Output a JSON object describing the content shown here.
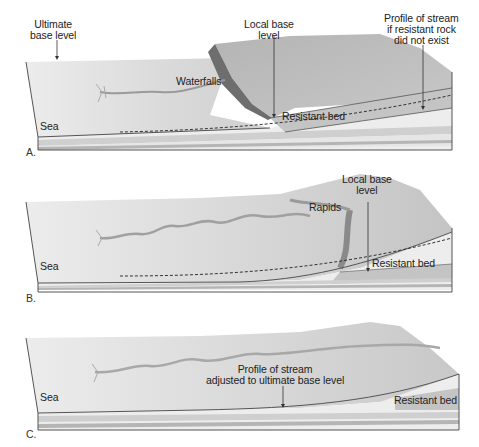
{
  "figure": {
    "colors": {
      "surface_light": "#e8e8e8",
      "surface_mid": "#d2d2d2",
      "upland_dark": "#a8a8a8",
      "cliff": "#6e6e6e",
      "layer_light": "#ededed",
      "layer_mid": "#cfcfcf",
      "layer_dark": "#b5b5b5",
      "resistant_bed": "#c4c4c4",
      "outline": "#555555",
      "text": "#222222"
    },
    "panels": [
      {
        "letter": "A.",
        "labels": {
          "ultimate_base_level_line1": "Ultimate",
          "ultimate_base_level_line2": "base level",
          "local_base_level_line1": "Local base",
          "local_base_level_line2": "level",
          "profile_line1": "Profile of stream",
          "profile_line2": "if resistant rock",
          "profile_line3": "did not exist",
          "waterfalls": "Waterfalls",
          "resistant_bed": "Resistant bed",
          "sea": "Sea"
        }
      },
      {
        "letter": "B.",
        "labels": {
          "local_base_level_line1": "Local base",
          "local_base_level_line2": "level",
          "rapids": "Rapids",
          "resistant_bed": "Resistant bed",
          "sea": "Sea"
        }
      },
      {
        "letter": "C.",
        "labels": {
          "profile_line1": "Profile of stream",
          "profile_line2": "adjusted to ultimate base level",
          "resistant_bed": "Resistant bed",
          "sea": "Sea"
        }
      }
    ]
  }
}
